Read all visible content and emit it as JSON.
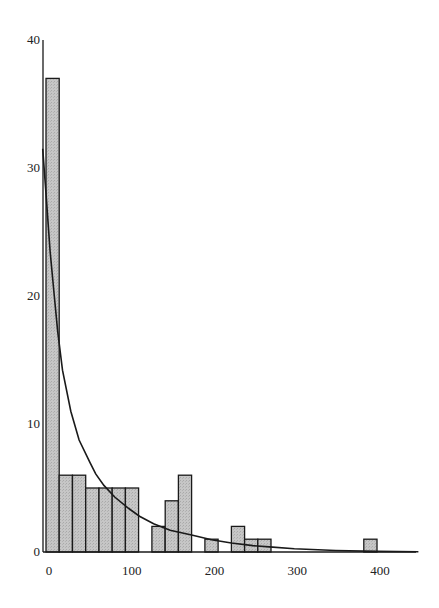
{
  "chart_data": {
    "type": "bar",
    "subtype": "histogram_with_fitted_curve",
    "title": "",
    "xlabel": "",
    "ylabel": "",
    "xlim": [
      0,
      450
    ],
    "ylim": [
      0,
      40
    ],
    "grid": false,
    "legend": null,
    "bin_width": 16,
    "x_ticks": [
      0,
      100,
      200,
      300,
      400
    ],
    "y_ticks": [
      0,
      10,
      20,
      30,
      40
    ],
    "x_tick_labels": [
      "0",
      "100",
      "200",
      "300",
      "400"
    ],
    "y_tick_labels": [
      "0",
      "10",
      "20",
      "30",
      "40"
    ],
    "bins": [
      {
        "start": 0,
        "end": 16,
        "count": 37
      },
      {
        "start": 16,
        "end": 32,
        "count": 6
      },
      {
        "start": 32,
        "end": 48,
        "count": 6
      },
      {
        "start": 48,
        "end": 64,
        "count": 5
      },
      {
        "start": 64,
        "end": 80,
        "count": 5
      },
      {
        "start": 80,
        "end": 96,
        "count": 5
      },
      {
        "start": 96,
        "end": 112,
        "count": 5
      },
      {
        "start": 128,
        "end": 144,
        "count": 2
      },
      {
        "start": 144,
        "end": 160,
        "count": 4
      },
      {
        "start": 160,
        "end": 176,
        "count": 6
      },
      {
        "start": 192,
        "end": 208,
        "count": 1
      },
      {
        "start": 224,
        "end": 240,
        "count": 2
      },
      {
        "start": 240,
        "end": 256,
        "count": 1
      },
      {
        "start": 256,
        "end": 272,
        "count": 1
      },
      {
        "start": 384,
        "end": 400,
        "count": 1
      }
    ],
    "series": [
      {
        "name": "fitted curve",
        "type": "line",
        "x": [
          -4,
          0,
          5,
          10,
          14,
          20,
          30,
          40,
          53,
          60,
          70,
          83,
          100,
          113,
          130,
          150,
          176,
          200,
          224,
          250,
          270,
          300,
          350,
          400,
          450
        ],
        "y": [
          31.5,
          28,
          23.5,
          20,
          17.3,
          14.2,
          11,
          8.75,
          7,
          6.1,
          5.2,
          4.3,
          3.4,
          2.8,
          2.2,
          1.7,
          1.33,
          0.95,
          0.7,
          0.5,
          0.4,
          0.25,
          0.12,
          0.05,
          0.02
        ]
      }
    ],
    "colors": {
      "bar_fill": "#c4c4c4",
      "bar_stroke": "#1a1a1a",
      "axis": "#1a1a1a",
      "curve": "#1a1a1a"
    }
  }
}
